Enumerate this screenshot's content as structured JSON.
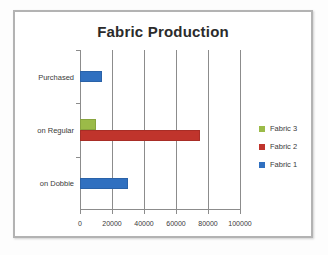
{
  "frame": {
    "border_color": "#b3b3b3"
  },
  "chart_data": {
    "type": "bar",
    "orientation": "horizontal",
    "title": "Fabric Production",
    "xlabel": "",
    "ylabel": "",
    "categories": [
      "on Dobbie",
      "on Regular",
      "Purchased"
    ],
    "series": [
      {
        "name": "Fabric 1",
        "color": "#3070c0",
        "values": [
          30000,
          0,
          14000
        ]
      },
      {
        "name": "Fabric 2",
        "color": "#c0342c",
        "values": [
          0,
          75000,
          0
        ]
      },
      {
        "name": "Fabric 3",
        "color": "#9bbb48",
        "values": [
          0,
          10000,
          0
        ]
      }
    ],
    "xlim": [
      0,
      100000
    ],
    "xticks": [
      0,
      20000,
      40000,
      60000,
      80000,
      100000
    ],
    "xticklabels": [
      "0",
      "20000",
      "40000",
      "60000",
      "80000",
      "100000"
    ],
    "grid": true,
    "grid_axis": "x",
    "legend_position": "right",
    "legend_order": [
      "Fabric 3",
      "Fabric 2",
      "Fabric 1"
    ]
  }
}
